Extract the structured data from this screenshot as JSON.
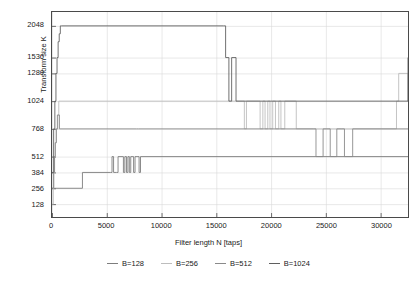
{
  "chart_data": {
    "type": "line",
    "title": "",
    "xlabel": "Filter length N [taps]",
    "ylabel": "Transform size K",
    "xlim": [
      0,
      32500
    ],
    "ylim": [
      64,
      2176
    ],
    "grid": true,
    "legend_position": "bottom",
    "xticks": [
      0,
      5000,
      10000,
      15000,
      20000,
      25000,
      30000
    ],
    "xticklabels": [
      "0",
      "5000",
      "10000",
      "15000",
      "20000",
      "25000",
      "30000"
    ],
    "yticks": [
      128,
      256,
      384,
      512,
      768,
      1024,
      1280,
      1536,
      2048
    ],
    "yticklabels": [
      "128",
      "256",
      "384",
      "512",
      "768",
      "1024",
      "1280",
      "1536",
      "2048"
    ],
    "y_scale_note": "piecewise-uniform tick spacing (categorical-like axis)",
    "series": [
      {
        "name": "B=128",
        "color": "#7d7d7d",
        "step": "post",
        "x": [
          0,
          2650,
          2780,
          5350,
          5480,
          5620,
          5900,
          6030,
          6520,
          6650,
          6800,
          6930,
          7060,
          7190,
          7450,
          7580,
          7950,
          8080,
          32500
        ],
        "y": [
          256,
          256,
          384,
          384,
          512,
          384,
          384,
          512,
          384,
          512,
          384,
          512,
          384,
          512,
          384,
          512,
          384,
          512,
          512
        ]
      },
      {
        "name": "B=256",
        "color": "#bdbdbd",
        "step": "post",
        "x": [
          0,
          120,
          180,
          240,
          300,
          380,
          480,
          620,
          17400,
          17560,
          17750,
          18850,
          19000,
          19250,
          19450,
          19700,
          19900,
          20150,
          20400,
          20700,
          20900,
          21250,
          22100,
          22300,
          31450,
          31650,
          32500
        ],
        "y": [
          128,
          256,
          384,
          512,
          640,
          768,
          896,
          1024,
          1024,
          768,
          1024,
          1024,
          768,
          1024,
          768,
          1024,
          768,
          1024,
          768,
          1024,
          768,
          1024,
          1024,
          768,
          1024,
          1280,
          1024
        ]
      },
      {
        "name": "B=512",
        "color": "#8a8a8a",
        "step": "post",
        "x": [
          0,
          140,
          220,
          300,
          400,
          520,
          680,
          7700,
          7900,
          23900,
          24100,
          24500,
          24750,
          25200,
          25400,
          25800,
          26000,
          26400,
          26700,
          27250,
          27450,
          32500
        ],
        "y": [
          256,
          384,
          512,
          640,
          768,
          896,
          768,
          768,
          768,
          768,
          512,
          512,
          768,
          768,
          512,
          512,
          768,
          768,
          512,
          512,
          768,
          768
        ]
      },
      {
        "name": "B=1024",
        "color": "#5f5f5f",
        "step": "post",
        "x": [
          0,
          150,
          260,
          360,
          460,
          560,
          660,
          760,
          860,
          15650,
          15850,
          16150,
          16400,
          16800,
          32500
        ],
        "y": [
          384,
          768,
          1024,
          1280,
          1536,
          1792,
          1920,
          2048,
          2048,
          2048,
          1536,
          1024,
          1536,
          1024,
          1536
        ]
      }
    ],
    "baseline_levels": {
      "B=1024_plateau": 2048,
      "B=512_plateau": 768,
      "B=256_plateau": 1024,
      "B=128_plateau": 512
    }
  },
  "axes": {
    "y_title": "Transform size K",
    "x_title": "Filter length N [taps]"
  },
  "legend": {
    "items": [
      {
        "label": "B=128"
      },
      {
        "label": "B=256"
      },
      {
        "label": "B=512"
      },
      {
        "label": "B=1024"
      }
    ]
  }
}
